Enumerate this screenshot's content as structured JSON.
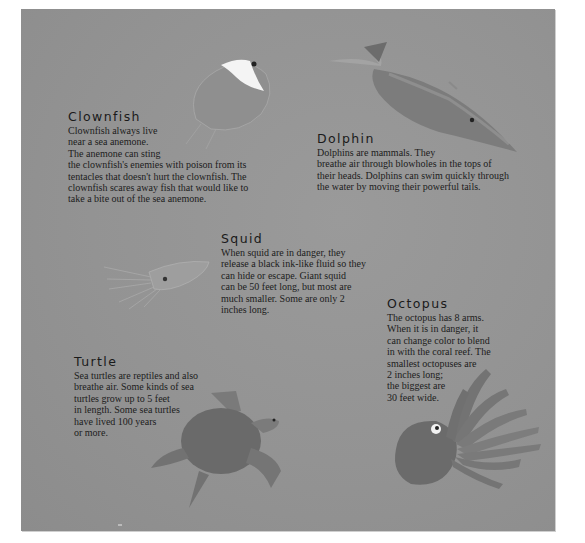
{
  "sections": {
    "clownfish": {
      "title": "Clownfish",
      "lines": [
        "Clownfish always live",
        "near a sea anemone.",
        "The anemone can sting",
        "the clownfish's enemies with poison from its",
        "tentacles that doesn't hurt the clownfish. The",
        "clownfish scares away fish that would like to",
        "take a bite out of the sea anemone."
      ]
    },
    "dolphin": {
      "title": "Dolphin",
      "lines": [
        "Dolphins are mammals. They",
        "breathe air through blowholes in the tops of",
        "their heads. Dolphins can swim quickly through",
        "the water by moving their powerful tails."
      ]
    },
    "squid": {
      "title": "Squid",
      "lines": [
        "When squid are in danger, they",
        "release a black ink-like fluid so they",
        "can hide or escape. Giant squid",
        "can be 50 feet long, but most are",
        "much smaller. Some are only 2",
        "inches long."
      ]
    },
    "octopus": {
      "title": "Octopus",
      "lines": [
        "The octopus has 8 arms.",
        "When it is in danger, it",
        "can change color to blend",
        "in with the coral reef. The",
        "smallest octopuses are",
        "2 inches long;",
        "the biggest are",
        "30 feet wide."
      ]
    },
    "turtle": {
      "title": "Turtle",
      "lines": [
        "Sea turtles are reptiles and also",
        "breathe air. Some kinds of sea",
        "turtles grow up to 5 feet",
        "in length. Some sea turtles",
        "have lived 100 years",
        "or more."
      ]
    }
  },
  "illustrations": [
    "clownfish-illustration",
    "dolphin-illustration",
    "squid-illustration",
    "octopus-illustration",
    "turtle-illustration"
  ],
  "colors": {
    "page_background": "#939393",
    "text": "#1c1c1c"
  }
}
